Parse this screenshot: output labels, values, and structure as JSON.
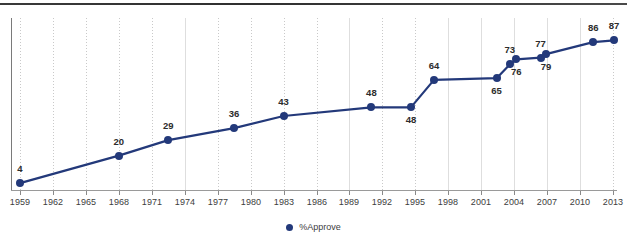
{
  "chart_data": {
    "type": "line",
    "title": "",
    "xlabel": "",
    "ylabel": "",
    "xlim": [
      1958,
      2014
    ],
    "ylim": [
      0,
      100
    ],
    "grid": true,
    "legend_position": "bottom",
    "legend": [
      "%Approve"
    ],
    "x_ticks": [
      "1959",
      "1962",
      "1965",
      "1968",
      "1971",
      "1974",
      "1977",
      "1980",
      "1983",
      "1986",
      "1989",
      "1992",
      "1995",
      "1998",
      "2001",
      "2004",
      "2007",
      "2010",
      "2013"
    ],
    "series": [
      {
        "name": "%Approve",
        "color": "#23397a",
        "points": [
          {
            "x": 1959,
            "y": 4,
            "label": "4",
            "label_pos": "above"
          },
          {
            "x": 1968,
            "y": 20,
            "label": "20",
            "label_pos": "above"
          },
          {
            "x": 1972.5,
            "y": 29,
            "label": "29",
            "label_pos": "above"
          },
          {
            "x": 1978.5,
            "y": 36,
            "label": "36",
            "label_pos": "above"
          },
          {
            "x": 1983,
            "y": 43,
            "label": "43",
            "label_pos": "above"
          },
          {
            "x": 1991,
            "y": 48,
            "label": "48",
            "label_pos": "above"
          },
          {
            "x": 1994.6,
            "y": 48,
            "label": "48",
            "label_pos": "below"
          },
          {
            "x": 1996.7,
            "y": 64,
            "label": "64",
            "label_pos": "above"
          },
          {
            "x": 2002.4,
            "y": 65,
            "label": "65",
            "label_pos": "below"
          },
          {
            "x": 2003.6,
            "y": 73,
            "label": "73",
            "label_pos": "above"
          },
          {
            "x": 2004.2,
            "y": 76,
            "label": "76",
            "label_pos": "below"
          },
          {
            "x": 2006.4,
            "y": 77,
            "label": "77",
            "label_pos": "above"
          },
          {
            "x": 2006.9,
            "y": 79,
            "label": "79",
            "label_pos": "below"
          },
          {
            "x": 2011.2,
            "y": 86,
            "label": "86",
            "label_pos": "above"
          },
          {
            "x": 2013.1,
            "y": 87,
            "label": "87",
            "label_pos": "above"
          }
        ]
      }
    ]
  },
  "legend": {
    "entry_label": "%Approve",
    "marker_color": "#23397a"
  },
  "colors": {
    "series": "#23397a",
    "gridline": "#c9c9c9",
    "axis": "#8a8a8a",
    "label_text": "#2c2c2c",
    "tick_text": "#3d3d3d"
  }
}
